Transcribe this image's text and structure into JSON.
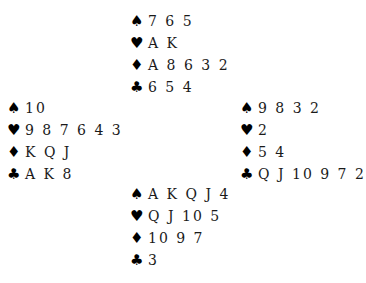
{
  "suits": {
    "spades": "♠",
    "hearts": "♥",
    "diamonds": "♦",
    "clubs": "♣"
  },
  "hands": {
    "north": {
      "spades": "7 6 5",
      "hearts": "A K",
      "diamonds": "A 8 6 3 2",
      "clubs": "6 5 4"
    },
    "west": {
      "spades": "10",
      "hearts": "9 8 7 6 4 3",
      "diamonds": "K Q J",
      "clubs": "A K 8"
    },
    "east": {
      "spades": "9 8 3 2",
      "hearts": "2",
      "diamonds": "5 4",
      "clubs": "Q J 10 9 7 2"
    },
    "south": {
      "spades": "A K Q J 4",
      "hearts": "Q J 10 5",
      "diamonds": "10 9 7",
      "clubs": "3"
    }
  }
}
